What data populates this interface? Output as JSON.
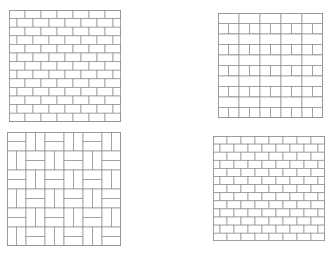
{
  "figure": {
    "width": 336,
    "height": 261,
    "background_color": "#ffffff",
    "panel_count": 4
  },
  "style": {
    "mortar_color": "#8e8e8e",
    "brick_fill": "#ffffff",
    "panel_border_color": "#8e8e8e",
    "line_width": 0.7,
    "border_width": 0.8
  },
  "panels": [
    {
      "id": "panel-top-left",
      "name": "running-bond-coarse",
      "pattern_type": "running_bond",
      "position": "top-left",
      "x": 9,
      "y": 10,
      "width": 112,
      "height": 112,
      "brick_width": 16,
      "brick_height": 8.6,
      "offset_ratio": 0.5,
      "columns": 7,
      "rows": 13
    },
    {
      "id": "panel-top-right",
      "name": "herringbone",
      "pattern_type": "herringbone",
      "position": "top-right",
      "x": 218,
      "y": 13,
      "width": 105,
      "height": 105,
      "brick_width": 21,
      "brick_height": 10.5,
      "cell_size": 21,
      "columns": 5,
      "rows": 5
    },
    {
      "id": "panel-bottom-left",
      "name": "basketweave",
      "pattern_type": "basketweave",
      "position": "bottom-left",
      "x": 7,
      "y": 132,
      "width": 114,
      "height": 114,
      "cell_size": 19,
      "bricks_per_cell": 2,
      "brick_width": 19,
      "brick_height": 9.5,
      "columns": 6,
      "rows": 6
    },
    {
      "id": "panel-bottom-right",
      "name": "running-bond-fine",
      "pattern_type": "running_bond",
      "position": "bottom-right",
      "x": 213,
      "y": 136,
      "width": 112,
      "height": 105,
      "brick_width": 14,
      "brick_height": 8.1,
      "offset_ratio": 0.5,
      "columns": 8,
      "rows": 13
    }
  ]
}
